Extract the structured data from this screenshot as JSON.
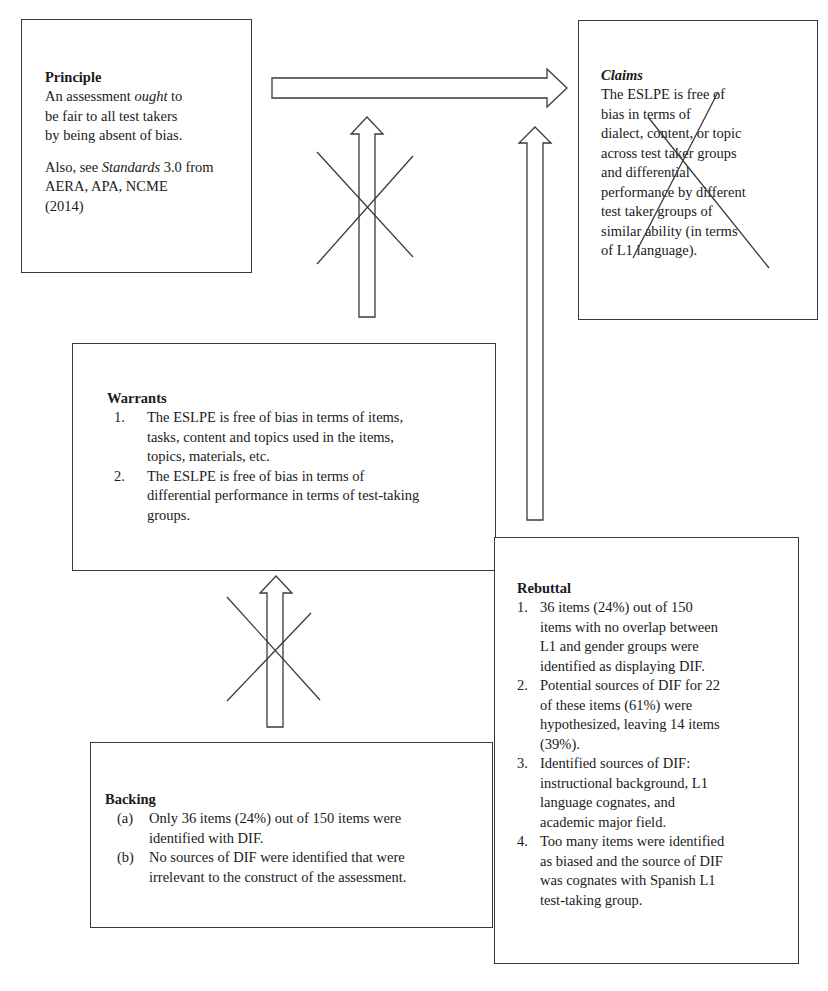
{
  "diagram": {
    "type": "Toulmin argument diagram",
    "principle": {
      "title": "Principle",
      "line1_pre": "An assessment ",
      "line1_em": "ought",
      "line1_post": " to",
      "line2": "be fair to all test takers",
      "line3": "by being absent of bias.",
      "note_pre": "Also, see ",
      "note_em": "Standards",
      "note_post": " 3.0 from",
      "note_line2": "AERA, APA, NCME",
      "note_line3": "(2014)"
    },
    "claims": {
      "title": "Claims",
      "lines": [
        "The ESLPE is free of",
        "bias in terms of",
        "dialect, content, or topic",
        "across test taker groups",
        "and differential",
        "performance by different",
        "test taker groups of",
        "similar ability (in terms",
        "of L1 language)."
      ],
      "crossed_out": true
    },
    "warrants": {
      "title": "Warrants",
      "items": [
        {
          "num": "1.",
          "lines": [
            "The ESLPE is free of bias in terms of items,",
            "tasks, content and topics used in the items,",
            "topics, materials, etc."
          ]
        },
        {
          "num": "2.",
          "lines": [
            "The ESLPE is free of bias in terms of",
            "differential performance in terms of test-taking",
            "groups."
          ]
        }
      ]
    },
    "rebuttal": {
      "title": "Rebuttal",
      "items": [
        {
          "num": "1.",
          "lines": [
            "36 items (24%) out of 150",
            "items with no overlap between",
            "L1 and gender groups were",
            "identified as displaying DIF."
          ]
        },
        {
          "num": "2.",
          "lines": [
            "Potential sources of DIF for 22",
            "of these items (61%) were",
            "hypothesized, leaving 14 items",
            "(39%)."
          ]
        },
        {
          "num": "3.",
          "lines": [
            "Identified sources of DIF:",
            "instructional background, L1",
            "language cognates, and",
            "academic major field."
          ]
        },
        {
          "num": "4.",
          "lines": [
            "Too many items were identified",
            "as biased and the source of DIF",
            "was cognates with Spanish L1",
            "test-taking group."
          ]
        }
      ]
    },
    "backing": {
      "title": "Backing",
      "items": [
        {
          "num": "(a)",
          "lines": [
            "Only 36 items (24%) out of 150 items were",
            "identified with DIF."
          ]
        },
        {
          "num": "(b)",
          "lines": [
            "No sources of DIF were identified that were",
            "irrelevant to the construct of the assessment."
          ]
        }
      ]
    },
    "arrows": [
      {
        "from": "principle",
        "to": "claims",
        "direction": "right",
        "crossed_out": false
      },
      {
        "from": "warrants",
        "to": "principle-claims link",
        "direction": "up",
        "crossed_out": true
      },
      {
        "from": "rebuttal",
        "to": "claims",
        "direction": "up",
        "crossed_out": false
      },
      {
        "from": "backing",
        "to": "warrants",
        "direction": "up",
        "crossed_out": true
      }
    ],
    "colors": {
      "line": "#3a3a3a",
      "text": "#1a1a1a",
      "background": "#ffffff"
    }
  }
}
